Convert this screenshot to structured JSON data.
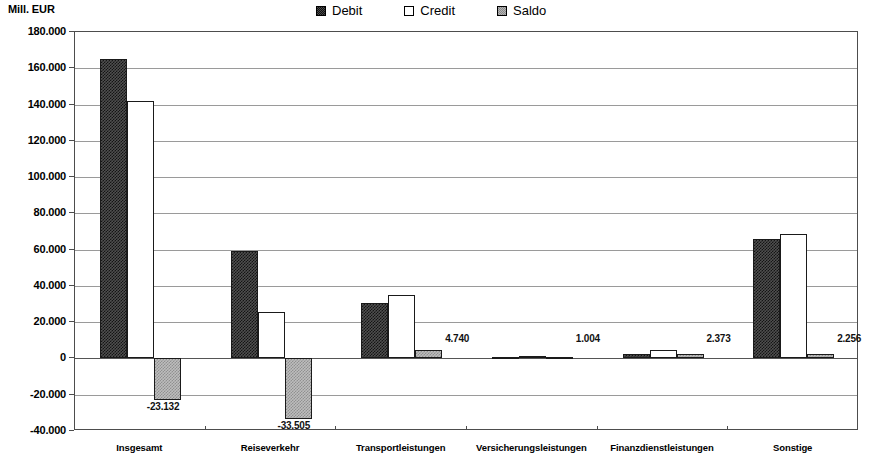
{
  "chart_data": {
    "type": "bar",
    "title": "",
    "subtitle": "",
    "xlabel": "",
    "ylabel": "Mill. EUR",
    "ylim": [
      -40000,
      180000
    ],
    "ytick_step": 20000,
    "grid": true,
    "legend_position": "top-right",
    "ytick_labels": [
      "180.000",
      "160.000",
      "140.000",
      "120.000",
      "100.000",
      "80.000",
      "60.000",
      "40.000",
      "20.000",
      "0",
      "-20.000",
      "-40.000"
    ],
    "ytick_values": [
      180000,
      160000,
      140000,
      120000,
      100000,
      80000,
      60000,
      40000,
      20000,
      0,
      -20000,
      -40000
    ],
    "categories": [
      "Insgesamt",
      "Reiseverkehr",
      "Transportleistungen",
      "Versicherungsleistungen",
      "Finanzdienstleistungen",
      "Sonstige"
    ],
    "series": [
      {
        "name": "Debit",
        "color": "#3f3f3f",
        "values": [
          165200,
          59000,
          30500,
          600,
          2450,
          66100
        ]
      },
      {
        "name": "Credit",
        "color": "#ffffff",
        "values": [
          142050,
          25500,
          35240,
          1604,
          4823,
          68350
        ]
      },
      {
        "name": "Saldo",
        "color": "#bdbdbd",
        "values": [
          -23132,
          -33505,
          4740,
          1004,
          2373,
          2256
        ]
      }
    ],
    "point_labels": {
      "Saldo": [
        "-23.132",
        "-33.505",
        "4.740",
        "1.004",
        "2.373",
        "2.256"
      ]
    }
  },
  "legend": {
    "items": [
      {
        "label": "Debit",
        "swatch": "debit-swatch-icon"
      },
      {
        "label": "Credit",
        "swatch": "credit-swatch-icon"
      },
      {
        "label": "Saldo",
        "swatch": "saldo-swatch-icon"
      }
    ]
  },
  "axis": {
    "unit_caption": "Mill. EUR"
  }
}
